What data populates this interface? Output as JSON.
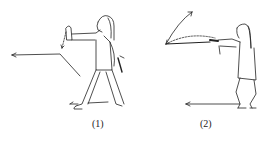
{
  "figures": [
    {
      "id": "1",
      "caption": "(1)",
      "description": "Figure standing in bow stance, left hand raised, sword held behind, arrow pointing left"
    },
    {
      "id": "2",
      "caption": "(2)",
      "description": "Figure in squat stance thrusting sword forward with arc arrow, arrow along ground pointing left"
    }
  ],
  "colors": {
    "ink": "#222222",
    "background": "#ffffff"
  }
}
